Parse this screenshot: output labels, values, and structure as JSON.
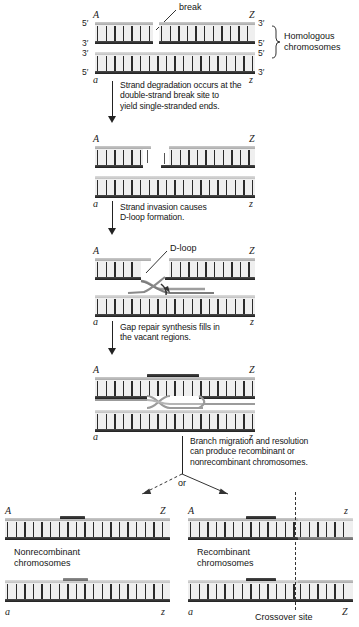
{
  "figure": {
    "type": "process-diagram"
  },
  "labels": {
    "break": "break",
    "homologous_chromosomes": "Homologous\nchromosomes",
    "homologous_line1": "Homologous",
    "homologous_line2": "chromosomes",
    "d_loop": "D-loop",
    "or": "or",
    "nonrecombinant_line1": "Nonrecombinant",
    "nonrecombinant_line2": "chromosomes",
    "recombinant_line1": "Recombinant",
    "recombinant_line2": "chromosomes",
    "crossover_site": "Crossover site"
  },
  "steps": [
    {
      "id": "step-1",
      "text_lines": [
        "Strand degradation occurs at the",
        "double-strand break site to",
        "yield single-stranded ends."
      ]
    },
    {
      "id": "step-2",
      "text_lines": [
        "Strand invasion causes",
        "D-loop formation."
      ]
    },
    {
      "id": "step-3",
      "text_lines": [
        "Gap repair synthesis fills in",
        "the vacant regions."
      ]
    },
    {
      "id": "step-4",
      "text_lines": [
        "Branch migration and resolution",
        "can produce recombinant or",
        "nonrecombinant chromosomes."
      ]
    }
  ],
  "stages": [
    {
      "id": "stage-initial",
      "gene_left_upper": "A",
      "gene_right_upper": "Z",
      "gene_left_lower": "a",
      "gene_right_lower": "z",
      "polarity_left": [
        "5′",
        "3′",
        "3′",
        "5′"
      ],
      "polarity_right": [
        "3′",
        "5′",
        "5′",
        "3′"
      ]
    },
    {
      "id": "stage-degradation",
      "gene_left_upper": "A",
      "gene_right_upper": "Z",
      "gene_left_lower": "a",
      "gene_right_lower": "z"
    },
    {
      "id": "stage-d-loop",
      "gene_left_upper": "A",
      "gene_right_upper": "Z",
      "gene_left_lower": "a",
      "gene_right_lower": "z"
    },
    {
      "id": "stage-gap-repair",
      "gene_left_upper": "A",
      "gene_right_upper": "Z",
      "gene_left_lower": "a",
      "gene_right_lower": "z"
    }
  ],
  "outcomes": [
    {
      "id": "outcome-nonrecombinant",
      "title_line1": "Nonrecombinant",
      "title_line2": "chromosomes",
      "upper_left": "A",
      "upper_right": "Z",
      "lower_left": "a",
      "lower_right": "z"
    },
    {
      "id": "outcome-recombinant",
      "title_line1": "Recombinant",
      "title_line2": "chromosomes",
      "upper_left": "A",
      "upper_right": "z",
      "lower_left": "a",
      "lower_right": "Z",
      "marker": "Crossover site"
    }
  ],
  "colors": {
    "strand_light": "#c9c9c9",
    "strand_dark": "#2b2b2b",
    "text": "#141414",
    "background": "#ffffff"
  }
}
